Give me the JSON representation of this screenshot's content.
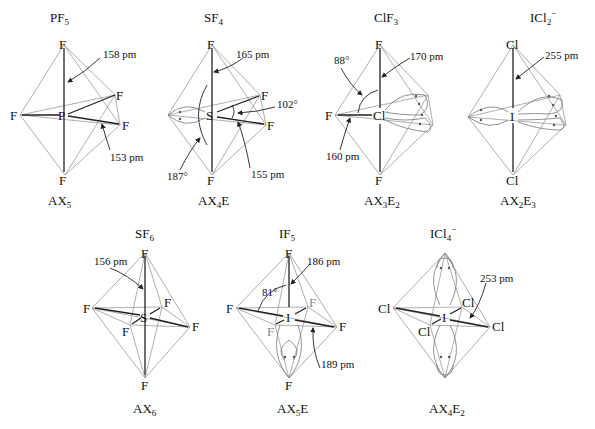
{
  "figure": {
    "molecules": [
      {
        "id": "pf5",
        "formula": "PF",
        "formula_sub": "5",
        "formula_sup": "",
        "central": "P",
        "ligands": [
          "F",
          "F",
          "F",
          "F",
          "F"
        ],
        "type": "AX",
        "type_sub1": "5",
        "type_E": "",
        "type_sub2": "",
        "annotations": [
          {
            "text": "158 pm",
            "role": "axial bond length"
          },
          {
            "text": "153 pm",
            "role": "equatorial bond length"
          }
        ]
      },
      {
        "id": "sf4",
        "formula": "SF",
        "formula_sub": "4",
        "formula_sup": "",
        "central": "S",
        "ligands": [
          "F",
          "F",
          "F",
          "F"
        ],
        "type": "AX",
        "type_sub1": "4",
        "type_E": "E",
        "type_sub2": "",
        "annotations": [
          {
            "text": "165 pm",
            "role": "axial bond length"
          },
          {
            "text": "102°",
            "role": "equatorial angle"
          },
          {
            "text": "187°",
            "role": "axial angle"
          },
          {
            "text": "155 pm",
            "role": "equatorial bond length"
          }
        ]
      },
      {
        "id": "clf3",
        "formula": "ClF",
        "formula_sub": "3",
        "formula_sup": "",
        "central": "Cl",
        "ligands": [
          "F",
          "F",
          "F"
        ],
        "type": "AX",
        "type_sub1": "3",
        "type_E": "E",
        "type_sub2": "2",
        "annotations": [
          {
            "text": "88°",
            "role": "F-Cl-F angle"
          },
          {
            "text": "170 pm",
            "role": "axial bond length"
          },
          {
            "text": "160 pm",
            "role": "equatorial bond length"
          }
        ]
      },
      {
        "id": "icl2",
        "formula": "ICl",
        "formula_sub": "2",
        "formula_sup": "−",
        "central": "I",
        "ligands": [
          "Cl",
          "Cl"
        ],
        "type": "AX",
        "type_sub1": "2",
        "type_E": "E",
        "type_sub2": "3",
        "annotations": [
          {
            "text": "255 pm",
            "role": "bond length"
          }
        ]
      },
      {
        "id": "sf6",
        "formula": "SF",
        "formula_sub": "6",
        "formula_sup": "",
        "central": "S",
        "ligands": [
          "F",
          "F",
          "F",
          "F",
          "F",
          "F"
        ],
        "type": "AX",
        "type_sub1": "6",
        "type_E": "",
        "type_sub2": "",
        "annotations": [
          {
            "text": "156 pm",
            "role": "bond length"
          }
        ]
      },
      {
        "id": "if5",
        "formula": "IF",
        "formula_sub": "5",
        "formula_sup": "",
        "central": "I",
        "ligands": [
          "F",
          "F",
          "F",
          "F",
          "F"
        ],
        "type": "AX",
        "type_sub1": "5",
        "type_E": "E",
        "type_sub2": "",
        "annotations": [
          {
            "text": "186 pm",
            "role": "axial bond length"
          },
          {
            "text": "81°",
            "role": "axial-equatorial angle"
          },
          {
            "text": "189 pm",
            "role": "equatorial bond length"
          }
        ]
      },
      {
        "id": "icl4",
        "formula": "ICl",
        "formula_sub": "4",
        "formula_sup": "−",
        "central": "I",
        "ligands": [
          "Cl",
          "Cl",
          "Cl",
          "Cl"
        ],
        "type": "AX",
        "type_sub1": "4",
        "type_E": "E",
        "type_sub2": "2",
        "annotations": [
          {
            "text": "253 pm",
            "role": "bond length"
          }
        ]
      }
    ]
  },
  "labels": {
    "F": "F",
    "P": "P",
    "S": "S",
    "Cl": "Cl",
    "I": "I",
    "pf5": {
      "a1": "158 pm",
      "a2": "153 pm"
    },
    "sf4": {
      "a1": "165 pm",
      "a2": "102°",
      "a3": "187°",
      "a4": "155 pm"
    },
    "clf3": {
      "a1": "88°",
      "a2": "170 pm",
      "a3": "160 pm"
    },
    "icl2": {
      "a1": "255 pm"
    },
    "sf6": {
      "a1": "156 pm"
    },
    "if5": {
      "a1": "186 pm",
      "a2": "81°",
      "a3": "189 pm"
    },
    "icl4": {
      "a1": "253 pm"
    }
  },
  "titles": {
    "pf5": {
      "main": "PF",
      "sub": "5",
      "sup": ""
    },
    "sf4": {
      "main": "SF",
      "sub": "4",
      "sup": ""
    },
    "clf3": {
      "main": "ClF",
      "sub": "3",
      "sup": ""
    },
    "icl2": {
      "main": "ICl",
      "sub": "2",
      "sup": "−"
    },
    "sf6": {
      "main": "SF",
      "sub": "6",
      "sup": ""
    },
    "if5": {
      "main": "IF",
      "sub": "5",
      "sup": ""
    },
    "icl4": {
      "main": "ICl",
      "sub": "4",
      "sup": "−"
    }
  },
  "types": {
    "pf5": {
      "a": "AX",
      "n": "5",
      "e": "",
      "m": ""
    },
    "sf4": {
      "a": "AX",
      "n": "4",
      "e": "E",
      "m": ""
    },
    "clf3": {
      "a": "AX",
      "n": "3",
      "e": "E",
      "m": "2"
    },
    "icl2": {
      "a": "AX",
      "n": "2",
      "e": "E",
      "m": "3"
    },
    "sf6": {
      "a": "AX",
      "n": "6",
      "e": "",
      "m": ""
    },
    "if5": {
      "a": "AX",
      "n": "5",
      "e": "E",
      "m": ""
    },
    "icl4": {
      "a": "AX",
      "n": "4",
      "e": "E",
      "m": "2"
    }
  }
}
